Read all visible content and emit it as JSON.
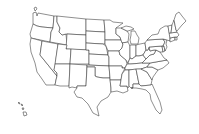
{
  "map": {
    "type": "us-states-outline",
    "background": "#ffffff",
    "fill": "#ffffff",
    "stroke": "#333333",
    "states": [
      {
        "id": "WA",
        "d": "M33,13 L36,12 L37,16 L38,13 L54,16 L53,28 L42,27 L37,26 L33,24 Z"
      },
      {
        "id": "OR",
        "d": "M33,24 L37,26 L42,27 L53,28 L51,32 L50,42 L31,38 L30,34 Z"
      },
      {
        "id": "CA",
        "d": "M31,38 L42,41 L40,55 L57,76 L56,80 L55,85 L46,85 L42,79 L37,72 L35,63 L31,52 L30,44 Z"
      },
      {
        "id": "ID",
        "d": "M54,16 L57,16 L57,22 L60,28 L59,32 L62,35 L66,34 L67,45 L50,42 L51,32 L53,28 Z"
      },
      {
        "id": "NV",
        "d": "M42,41 L58,44 L55,66 L54,70 L57,73 L57,76 L40,55 Z"
      },
      {
        "id": "MT",
        "d": "M57,16 L86,19 L86,35 L67,34 L66,34 L62,35 L59,32 L60,28 L57,22 Z"
      },
      {
        "id": "WY",
        "d": "M67,34 L86,35 L86,50 L66,49 Z"
      },
      {
        "id": "UT",
        "d": "M58,44 L67,45 L66,49 L71,49 L70,64 L55,64 Z"
      },
      {
        "id": "AZ",
        "d": "M55,64 L70,64 L69,86 L60,86 L55,85 L56,80 L57,76 L57,73 L54,70 Z"
      },
      {
        "id": "CO",
        "d": "M71,49 L89,50 L89,64 L70,64 Z"
      },
      {
        "id": "NM",
        "d": "M70,64 L87,65 L86,86 L77,86 L77,88 L72,87 L69,88 L69,86 Z"
      },
      {
        "id": "ND",
        "d": "M86,19 L104,20 L105,32 L86,31 Z"
      },
      {
        "id": "SD",
        "d": "M86,31 L105,32 L105,44 L103,44 L86,43 Z"
      },
      {
        "id": "NE",
        "d": "M86,43 L103,44 L106,46 L108,55 L89,54 L89,50 L86,50 Z"
      },
      {
        "id": "KS",
        "d": "M89,54 L108,55 L109,57 L109,66 L89,65 Z"
      },
      {
        "id": "OK",
        "d": "M87,65 L109,66 L110,78 L103,78 L97,77 L95,76 L95,67 L87,67 Z"
      },
      {
        "id": "TX",
        "d": "M87,67 L95,67 L95,76 L97,77 L103,78 L110,78 L111,88 L111,92 L108,97 L101,101 L97,107 L99,116 L93,113 L88,104 L82,98 L77,97 L74,92 L77,88 L77,86 L86,86 Z"
      },
      {
        "id": "MN",
        "d": "M104,20 L110,20 L113,22 L123,23 L116,28 L116,34 L120,37 L121,40 L105,40 L105,32 Z"
      },
      {
        "id": "IA",
        "d": "M105,40 L121,40 L123,44 L122,48 L119,51 L108,51 L106,46 L105,44 Z"
      },
      {
        "id": "MO",
        "d": "M108,51 L119,51 L120,55 L126,60 L127,64 L125,68 L122,68 L122,66 L109,66 L109,57 L108,55 Z"
      },
      {
        "id": "AR",
        "d": "M109,66 L122,66 L122,68 L125,68 L122,74 L121,80 L110,80 L110,78 Z"
      },
      {
        "id": "LA",
        "d": "M110,80 L121,80 L120,86 L127,86 L128,91 L123,93 L117,91 L111,92 L111,88 Z"
      },
      {
        "id": "WI",
        "d": "M116,28 L121,28 L127,31 L129,34 L128,42 L122,43 L121,40 L120,37 L116,34 Z"
      },
      {
        "id": "IL",
        "d": "M122,43 L128,42 L130,46 L130,58 L128,63 L126,60 L120,55 L119,51 L122,48 L123,44 Z"
      },
      {
        "id": "MI",
        "d": "M121,28 L126,26 L131,27 L134,29 L128,31 L127,31 Z M131,31 L135,31 L137,35 L139,38 L138,44 L131,44 L130,40 L131,35 Z"
      },
      {
        "id": "IN",
        "d": "M130,45 L136,45 L136,56 L132,59 L130,58 L130,46 Z"
      },
      {
        "id": "OH",
        "d": "M136,45 L140,44 L145,43 L146,50 L143,55 L139,56 L136,56 Z"
      },
      {
        "id": "KY",
        "d": "M128,63 L130,58 L132,59 L136,56 L139,56 L143,55 L146,59 L142,63 L131,64 L128,64 Z"
      },
      {
        "id": "TN",
        "d": "M125,68 L127,64 L131,64 L142,63 L150,63 L147,67 L141,69 L125,70 Z"
      },
      {
        "id": "MS",
        "d": "M122,74 L125,70 L129,70 L129,86 L128,88 L127,86 L120,86 L121,80 Z"
      },
      {
        "id": "AL",
        "d": "M129,70 L136,69 L139,84 L133,84 L133,88 L131,88 L129,86 Z"
      },
      {
        "id": "GA",
        "d": "M136,69 L141,69 L147,72 L152,80 L151,85 L141,86 L139,84 Z"
      },
      {
        "id": "FL",
        "d": "M131,88 L133,88 L133,84 L139,84 L141,86 L151,85 L152,84 L156,93 L160,102 L162,110 L160,114 L156,110 L151,100 L150,94 L146,90 L142,89 L136,88 Z"
      },
      {
        "id": "SC",
        "d": "M141,69 L147,67 L152,67 L158,70 L153,77 L152,80 L147,72 Z"
      },
      {
        "id": "NC",
        "d": "M147,67 L150,63 L167,60 L169,63 L163,68 L158,70 L152,67 Z"
      },
      {
        "id": "VA",
        "d": "M142,63 L146,59 L150,55 L154,54 L156,50 L160,52 L164,58 L167,60 L150,63 Z"
      },
      {
        "id": "WV",
        "d": "M143,55 L146,50 L148,50 L149,47 L150,51 L154,50 L156,50 L154,54 L150,55 L146,59 Z"
      },
      {
        "id": "MD",
        "d": "M149,47 L162,46 L163,52 L160,52 L156,50 L154,50 L150,51 Z"
      },
      {
        "id": "DE",
        "d": "M162,46 L164,46 L165,51 L163,52 Z"
      },
      {
        "id": "PA",
        "d": "M145,43 L147,40 L163,39 L165,42 L163,46 L162,46 L149,47 L148,50 L146,50 Z"
      },
      {
        "id": "NJ",
        "d": "M163,39 L167,40 L166,44 L167,47 L165,51 L164,46 L163,46 L165,42 Z"
      },
      {
        "id": "NY",
        "d": "M147,40 L152,35 L158,34 L160,29 L165,26 L168,26 L170,36 L170,41 L167,40 L163,39 Z"
      },
      {
        "id": "CT",
        "d": "M170,38 L175,37 L175,40 L170,42 Z"
      },
      {
        "id": "RI",
        "d": "M175,37 L177,37 L177,40 L175,40 Z"
      },
      {
        "id": "MA",
        "d": "M169,33 L177,32 L179,35 L177,37 L175,37 L170,38 Z"
      },
      {
        "id": "VT",
        "d": "M168,26 L172,25 L171,33 L169,33 Z"
      },
      {
        "id": "NH",
        "d": "M172,25 L174,20 L176,30 L177,32 L171,33 Z"
      },
      {
        "id": "ME",
        "d": "M174,20 L176,14 L179,12 L182,16 L186,21 L182,25 L177,31 L176,30 Z"
      },
      {
        "id": "AK",
        "d": "M34,8 L36,7 L37,9 L35,11 Z"
      },
      {
        "id": "HI",
        "d": "M18,103 L19,102 L20,104 Z M21,104 L23,105 L22,106 Z M22,108 L24,108 L23,110 Z M23,112 L26,112 L27,115 L24,116 Z"
      }
    ]
  }
}
